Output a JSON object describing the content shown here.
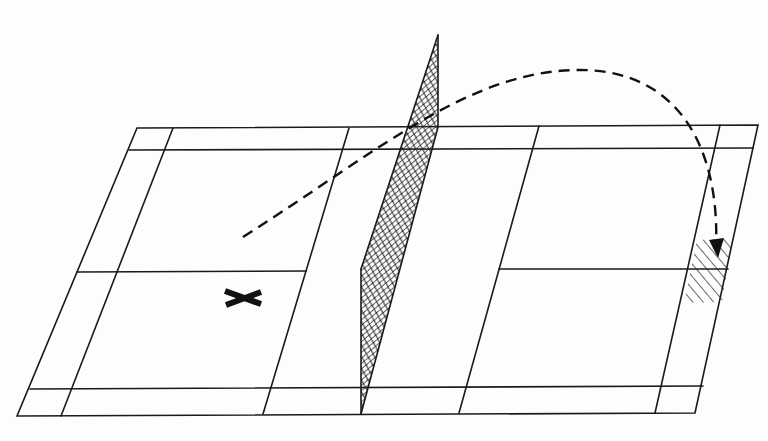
{
  "diagram": {
    "description": "Perspective view of a badminton court with a net, a dashed shuttle trajectory clearing the net and landing in a hatched target area near the far back-right corner, and an X marking the player position.",
    "colors": {
      "background": "#fdfdfd",
      "lines": "#1a1a1a",
      "trajectory": "#111111"
    },
    "court": {
      "outer_corners": {
        "top_left": [
          137,
          128
        ],
        "top_right": [
          758,
          125
        ],
        "bottom_right": [
          695,
          413
        ],
        "bottom_left": [
          17,
          416
        ]
      },
      "lines": [
        {
          "name": "doubles-long-service-top",
          "from": [
            129,
            150
          ],
          "to": [
            753,
            148
          ]
        },
        {
          "name": "doubles-long-service-bottom",
          "from": [
            30,
            389
          ],
          "to": [
            703,
            386
          ]
        },
        {
          "name": "left-side-line",
          "from": [
            173,
            128
          ],
          "to": [
            61,
            416
          ]
        },
        {
          "name": "left-short-service-line",
          "from": [
            349,
            128
          ],
          "to": [
            263,
            414
          ]
        },
        {
          "name": "right-short-service-line",
          "from": [
            539,
            126
          ],
          "to": [
            459,
            413
          ]
        },
        {
          "name": "right-side-line",
          "from": [
            720,
            125
          ],
          "to": [
            655,
            413
          ]
        },
        {
          "name": "left-center-line",
          "from": [
            77,
            272
          ],
          "to": [
            306,
            271
          ]
        },
        {
          "name": "right-center-line",
          "from": [
            499,
            269
          ],
          "to": [
            728,
            269
          ]
        }
      ]
    },
    "net": {
      "top_post": [
        438,
        35
      ],
      "top_base": [
        438,
        127
      ],
      "bottom_post": [
        361,
        414
      ],
      "mesh_bottom_left": [
        361,
        269
      ],
      "mesh_label": "net"
    },
    "trajectory": {
      "style": "dashed",
      "start": [
        243,
        237
      ],
      "apex": [
        580,
        70
      ],
      "end": [
        718,
        256
      ],
      "arrowhead": "down"
    },
    "target_area": {
      "style": "hatched",
      "corners": [
        [
          697,
          240
        ],
        [
          733,
          238
        ],
        [
          722,
          302
        ],
        [
          684,
          303
        ]
      ]
    },
    "player_marker": {
      "symbol": "X",
      "center": [
        243,
        298
      ]
    }
  }
}
